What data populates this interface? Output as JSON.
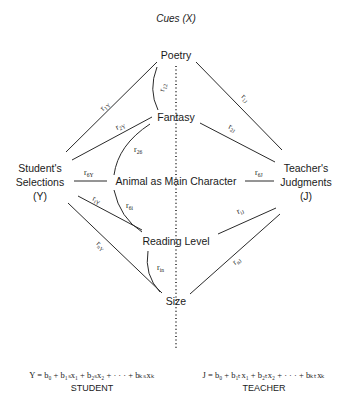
{
  "title": "Cues (X)",
  "cues": {
    "poetry": "Poetry",
    "fantasy": "Fantasy",
    "animal": "Animal as Main Character",
    "reading_level": "Reading Level",
    "size": "Size"
  },
  "student": {
    "line1": "Student's",
    "line2": "Selections",
    "line3": "(Y)"
  },
  "teacher": {
    "line1": "Teacher's",
    "line2": "Judgments",
    "line3": "(J)"
  },
  "correlations": {
    "r1Y": {
      "r": "r",
      "sub": "1Y"
    },
    "r2Y": {
      "r": "r",
      "sub": "2Y"
    },
    "r6Y": {
      "r": "r",
      "sub": "6Y"
    },
    "riY": {
      "r": "r",
      "sub": "iY"
    },
    "rnY": {
      "r": "r",
      "sub": "nY"
    },
    "r1J": {
      "r": "r",
      "sub": "1J"
    },
    "r2J": {
      "r": "r",
      "sub": "2J"
    },
    "r6J": {
      "r": "r",
      "sub": "6J"
    },
    "riJ": {
      "r": "r",
      "sub": "iJ"
    },
    "rnJ": {
      "r": "r",
      "sub": "nJ"
    },
    "r12": {
      "r": "r",
      "sub": "12"
    },
    "r26": {
      "r": "r",
      "sub": "26"
    },
    "r6i": {
      "r": "r",
      "sub": "6i"
    },
    "rin": {
      "r": "r",
      "sub": "in"
    }
  },
  "equations": {
    "student": {
      "formula": "Y = b₀ + b₁ₛx₁ + b₂ₛx₂ + · · · + bₖₛxₖ",
      "label": "STUDENT"
    },
    "teacher": {
      "formula": "J = b₀ + b₁ₜx₁ + b₂ₜx₂ + · · · + bₖₜxₖ",
      "label": "TEACHER"
    }
  }
}
